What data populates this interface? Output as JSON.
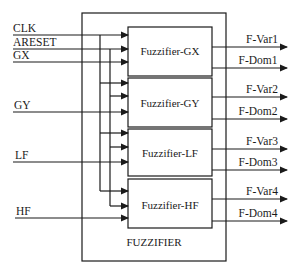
{
  "diagram": {
    "title": "FUZZIFIER",
    "inputs": [
      {
        "label": "CLK",
        "y": 35
      },
      {
        "label": "ARESET",
        "y": 49
      },
      {
        "label": "GX",
        "y": 62
      },
      {
        "label": "GY",
        "y": 112
      },
      {
        "label": "LF",
        "y": 162
      },
      {
        "label": "HF",
        "y": 218
      }
    ],
    "blocks": [
      {
        "label": "Fuzzifier-GX",
        "top": 27,
        "bottom": 76,
        "arrows_y": [
          35,
          49,
          62
        ],
        "outputs": [
          {
            "label": "F-Var1",
            "y": 47
          },
          {
            "label": "F-Dom1",
            "y": 68
          }
        ]
      },
      {
        "label": "Fuzzifier-GY",
        "top": 78,
        "bottom": 127,
        "arrows_y": [
          83,
          96,
          112
        ],
        "outputs": [
          {
            "label": "F-Var2",
            "y": 97
          },
          {
            "label": "F-Dom2",
            "y": 119
          }
        ]
      },
      {
        "label": "Fuzzifier-LF",
        "top": 129,
        "bottom": 176,
        "arrows_y": [
          133,
          147,
          162
        ],
        "outputs": [
          {
            "label": "F-Var3",
            "y": 149
          },
          {
            "label": "F-Dom3",
            "y": 170
          }
        ]
      },
      {
        "label": "Fuzzifier-HF",
        "top": 179,
        "bottom": 228,
        "arrows_y": [
          191,
          206,
          218
        ],
        "outputs": [
          {
            "label": "F-Var4",
            "y": 199
          },
          {
            "label": "F-Dom4",
            "y": 221
          }
        ]
      }
    ],
    "colors": {
      "line": "#1a1a1a",
      "background": "#ffffff"
    }
  }
}
